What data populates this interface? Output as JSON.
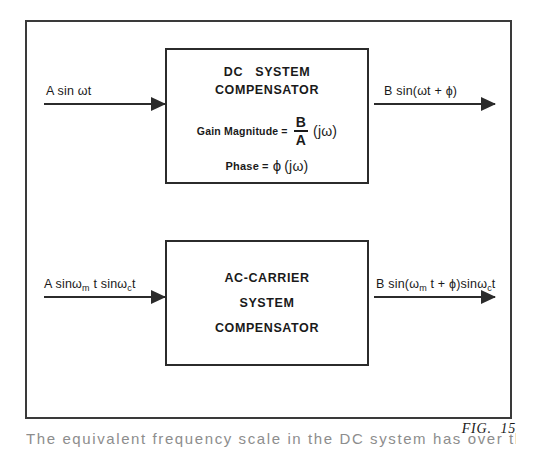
{
  "figure": {
    "caption": "FIG.  15",
    "frame_color": "#3a3a3a",
    "line_color": "#2b2b2b"
  },
  "dc_stage": {
    "block_title_line1": "DC   SYSTEM",
    "block_title_line2": "COMPENSATOR",
    "gain_label": "Gain Magnitude",
    "gain_equals": "=",
    "gain_numerator": "B",
    "gain_denominator": "A",
    "gain_argument": "(jω)",
    "phase_label": "Phase",
    "phase_equals": "=",
    "phase_symbol": "ϕ",
    "phase_argument": "(jω)",
    "input_label": "A sin ωt",
    "output_label": "B sin(ωt + ϕ)"
  },
  "ac_stage": {
    "block_title_line1": "AC-CARRIER",
    "block_title_line2": "SYSTEM",
    "block_title_line3": "COMPENSATOR",
    "input_prefix": "A sinω",
    "input_sub1": "m",
    "input_mid": " t sinω",
    "input_sub2": "c",
    "input_suffix": "t",
    "output_prefix": "B sin(ω",
    "output_sub1": "m",
    "output_mid": " t + ϕ)sinω",
    "output_sub2": "c",
    "output_suffix": "t"
  },
  "page_body": {
    "clipped_line": "The equivalent frequency scale in the DC system has over the modulating frequency"
  }
}
